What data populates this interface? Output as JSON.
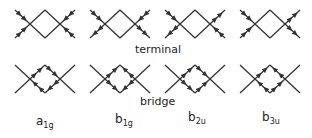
{
  "diagram": {
    "rows": [
      {
        "name": "terminal",
        "label": "terminal",
        "arrow_location": "terminal-lines"
      },
      {
        "name": "bridge",
        "label": "bridge",
        "arrow_location": "diamond-edges"
      }
    ],
    "columns": [
      {
        "symmetry": {
          "base": "a",
          "sub": "1g"
        }
      },
      {
        "symmetry": {
          "base": "b",
          "sub": "1g"
        }
      },
      {
        "symmetry": {
          "base": "b",
          "sub": "2u"
        }
      },
      {
        "symmetry": {
          "base": "b",
          "sub": "3u"
        }
      }
    ],
    "terminal_arrows": [
      [
        "in",
        "in",
        "in",
        "in"
      ],
      [
        "in",
        "out",
        "in",
        "out"
      ],
      [
        "in",
        "out",
        "out",
        "in"
      ],
      [
        "in",
        "in",
        "out",
        "out"
      ]
    ],
    "bridge_arrows": [
      [
        "cw",
        "cw",
        "cw",
        "cw"
      ],
      [
        "cw",
        "ccw",
        "cw",
        "ccw"
      ],
      [
        "cw",
        "cw",
        "ccw",
        "ccw"
      ],
      [
        "cw",
        "ccw",
        "ccw",
        "cw"
      ]
    ],
    "stroke_color": "#333333"
  }
}
